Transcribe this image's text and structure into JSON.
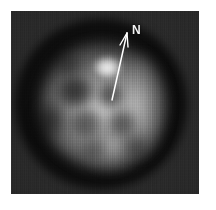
{
  "figure": {
    "kind": "grayscale-astronomical-image",
    "caption_text": "",
    "frame": {
      "x": 11,
      "y": 11,
      "width": 188,
      "height": 183,
      "background_color": "#272727",
      "page_background_color": "#ffffff"
    }
  },
  "annotations": {
    "north_arrow": {
      "label": "N",
      "label_color": "#f4f4f4",
      "line_color": "#ffffff",
      "tail_x": 112,
      "tail_y": 100,
      "head_x": 127,
      "head_y": 32,
      "description": "compass arrow indicating celestial north"
    }
  },
  "image_features": {
    "object_center_x": 100,
    "object_center_y": 105,
    "bright_knot_x": 107,
    "bright_knot_y": 69,
    "south_tail_x": 105,
    "south_tail_y": 155,
    "highlight_color": "#f2f2f2",
    "midtone_color": "#9a9a9a",
    "shadow_color": "#1a1a1a",
    "background_color": "#2a2a2a"
  }
}
